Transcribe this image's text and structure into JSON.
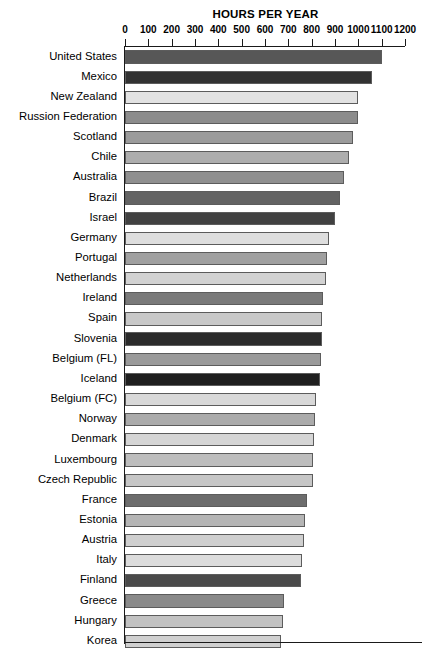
{
  "chart_data": {
    "type": "bar",
    "orientation": "horizontal",
    "title": "HOURS PER YEAR",
    "xlabel": "",
    "ylabel": "",
    "xlim": [
      0,
      1200
    ],
    "xticks": [
      0,
      100,
      200,
      300,
      400,
      500,
      600,
      700,
      800,
      900,
      1000,
      1100,
      1200
    ],
    "grid": false,
    "legend": null,
    "categories": [
      "United States",
      "Mexico",
      "New Zealand",
      "Russion Federation",
      "Scotland",
      "Chile",
      "Australia",
      "Brazil",
      "Israel",
      "Germany",
      "Portugal",
      "Netherlands",
      "Ireland",
      "Spain",
      "Slovenia",
      "Belgium (FL)",
      "Iceland",
      "Belgium (FC)",
      "Norway",
      "Denmark",
      "Luxembourg",
      "Czech Republic",
      "France",
      "Estonia",
      "Austria",
      "Italy",
      "Finland",
      "Greece",
      "Hungary",
      "Korea"
    ],
    "values": [
      1100,
      1060,
      1000,
      1000,
      975,
      960,
      940,
      920,
      900,
      875,
      865,
      860,
      850,
      845,
      845,
      840,
      835,
      820,
      815,
      810,
      805,
      805,
      780,
      770,
      765,
      760,
      755,
      680,
      675,
      670
    ],
    "bar_colors": [
      "#575757",
      "#323232",
      "#e2e2e2",
      "#8c8c8c",
      "#9b9b9b",
      "#adadad",
      "#8f8f8f",
      "#636363",
      "#414141",
      "#dedede",
      "#a0a0a0",
      "#d2d2d2",
      "#7a7a7a",
      "#c8c8c8",
      "#2b2b2b",
      "#9a9a9a",
      "#1f1f1f",
      "#d8d8d8",
      "#ababab",
      "#d5d5d5",
      "#bdbdbd",
      "#c6c6c6",
      "#6d6d6d",
      "#b5b5b5",
      "#cfcfcf",
      "#dcdcdc",
      "#4a4a4a",
      "#8a8a8a",
      "#c2c2c2",
      "#d0d0d0"
    ]
  }
}
